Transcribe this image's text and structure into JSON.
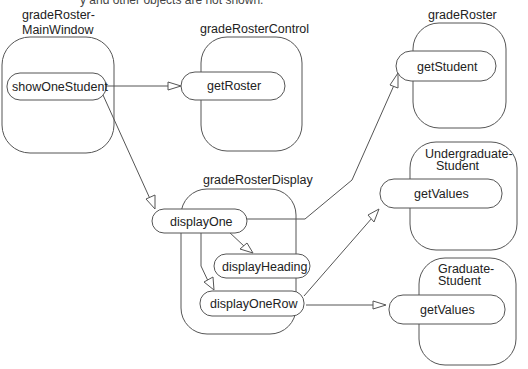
{
  "caption": "y and other objects are not shown.",
  "objects": [
    {
      "id": "mainwin",
      "title_lines": [
        "gradeRoster-",
        "MainWindow"
      ]
    },
    {
      "id": "control",
      "title_lines": [
        "gradeRosterControl"
      ]
    },
    {
      "id": "roster",
      "title_lines": [
        "gradeRoster"
      ]
    },
    {
      "id": "display",
      "title_lines": [
        "gradeRosterDisplay"
      ]
    },
    {
      "id": "ugrad",
      "title_lines": [
        "Undergraduate-",
        "Student"
      ]
    },
    {
      "id": "grad",
      "title_lines": [
        "Graduate-",
        "Student"
      ]
    }
  ],
  "operations": {
    "showOneStudent": "showOneStudent",
    "getRoster": "getRoster",
    "getStudent": "getStudent",
    "displayOne": "displayOne",
    "displayHeading": "displayHeading",
    "displayOneRow": "displayOneRow",
    "getValuesUgrad": "getValues",
    "getValuesGrad": "getValues"
  },
  "messages": [
    {
      "from": "showOneStudent",
      "to": "getRoster"
    },
    {
      "from": "showOneStudent",
      "to": "displayOne"
    },
    {
      "from": "displayOne",
      "to": "getStudent"
    },
    {
      "from": "displayOne",
      "to": "displayHeading"
    },
    {
      "from": "displayOne",
      "to": "displayOneRow"
    },
    {
      "from": "displayOneRow",
      "to": "getValues (Undergraduate-Student)"
    },
    {
      "from": "displayOneRow",
      "to": "getValues (Graduate-Student)"
    }
  ]
}
